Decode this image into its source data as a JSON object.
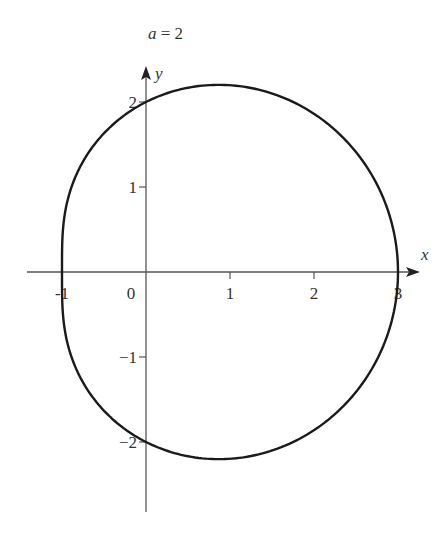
{
  "title": "a = 2",
  "title_parts": {
    "var": "a",
    "eq": " = 2"
  },
  "colors": {
    "axis": "#555555",
    "curve": "#1a1a1a",
    "text": "#333333"
  },
  "chart_data": {
    "type": "line",
    "title": "a = 2",
    "xlabel": "x",
    "ylabel": "y",
    "xlim": [
      -1.75,
      3.4
    ],
    "ylim": [
      -2.8,
      2.3
    ],
    "grid": false,
    "legend": null,
    "curve": {
      "description": "Closed limacon in polar form r = a + cos(theta), a = 2",
      "param_a": 2,
      "key_points": [
        {
          "x": 3,
          "y": 0
        },
        {
          "x": 0.866,
          "y": 2.2
        },
        {
          "x": 0,
          "y": 2
        },
        {
          "x": -1,
          "y": 0
        },
        {
          "x": 0,
          "y": -2
        },
        {
          "x": 0.866,
          "y": -2.2
        }
      ]
    },
    "x_ticks": [
      {
        "value": -1,
        "label": "-1"
      },
      {
        "value": 0,
        "label": "0"
      },
      {
        "value": 1,
        "label": "1"
      },
      {
        "value": 2,
        "label": "2"
      },
      {
        "value": 3,
        "label": "3"
      }
    ],
    "y_ticks": [
      {
        "value": 2,
        "label": "2"
      },
      {
        "value": 1,
        "label": "1"
      },
      {
        "value": -1,
        "label": "−1"
      },
      {
        "value": -2,
        "label": "−2"
      }
    ]
  },
  "layout": {
    "origin_px": [
      146,
      272
    ],
    "unit_x_px": 84,
    "unit_y_px": 85
  }
}
